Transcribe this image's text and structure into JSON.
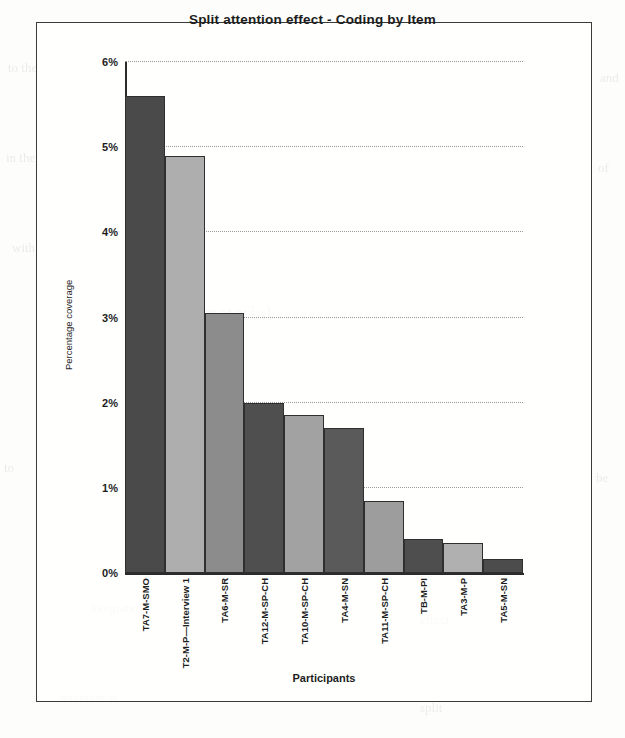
{
  "figure": {
    "border_color": "#3a3a3a",
    "background": "#fdfdfb"
  },
  "axis_titles": {
    "y": "Percentage coverage",
    "x": "Participants"
  },
  "chart_data": {
    "type": "bar",
    "title": "Split attention effect - Coding by Item",
    "xlabel": "Participants",
    "ylabel": "Percentage coverage",
    "ylim": [
      0,
      6
    ],
    "ytick_labels": [
      "0%",
      "1%",
      "2%",
      "3%",
      "4%",
      "5%",
      "6%"
    ],
    "ytick_values": [
      0,
      1,
      2,
      3,
      4,
      5,
      6
    ],
    "grid": true,
    "grid_axis": "y",
    "legend": "none",
    "units": "percent",
    "categories": [
      "TA7-M-SMO",
      "T2-M-P—Interview 1",
      "TA6-M-SR",
      "TA12-M-SP-CH",
      "TA10-M-SP-CH",
      "TA4-M-SN",
      "TA11-M-SP-CH",
      "TB-M-PI",
      "TA3-M-P",
      "TA5-M-SN"
    ],
    "values": [
      5.6,
      4.9,
      3.05,
      2.0,
      1.85,
      1.7,
      0.85,
      0.4,
      0.35,
      0.17
    ],
    "bar_colors": [
      "#4a4a4a",
      "#aeaeae",
      "#8c8c8c",
      "#4f4f4f",
      "#a2a2a2",
      "#5a5a5a",
      "#9d9d9d",
      "#4e4e4e",
      "#b0b0b0",
      "#4c4c4c"
    ]
  }
}
